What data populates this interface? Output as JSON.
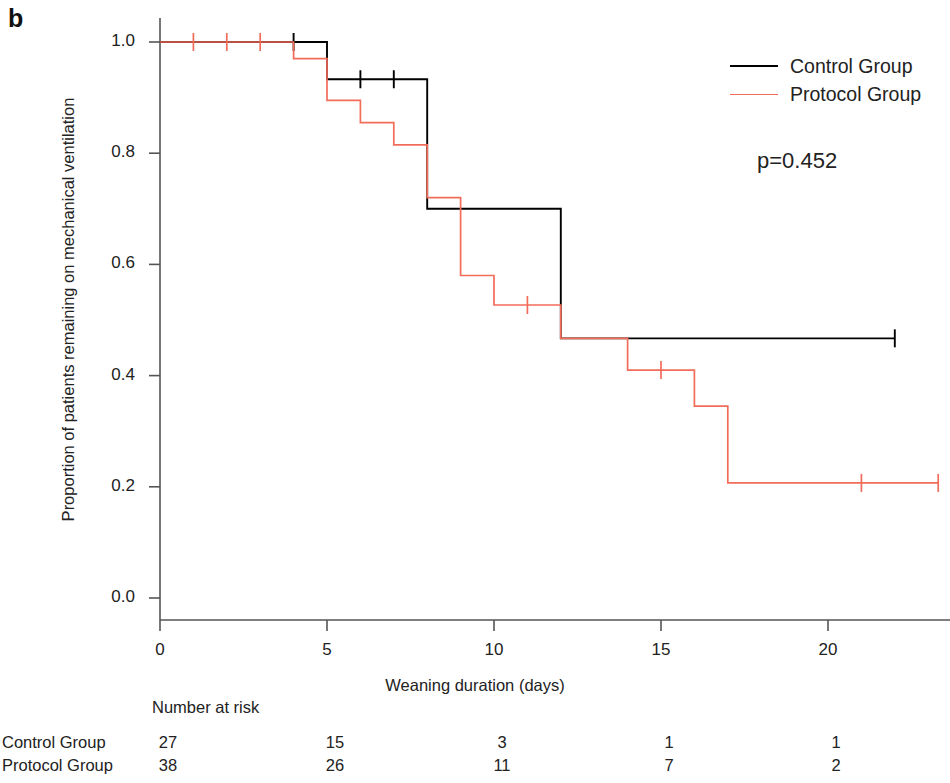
{
  "panel": {
    "label": "b"
  },
  "legend": {
    "position": "top-right",
    "items": [
      {
        "label": "Control Group",
        "color": "#000000"
      },
      {
        "label": "Protocol Group",
        "color": "#f26c5a"
      }
    ]
  },
  "stats": {
    "p_value_text": "p=0.452"
  },
  "risk_table": {
    "title": "Number at risk",
    "times": [
      0,
      5,
      10,
      15,
      20
    ],
    "rows": [
      {
        "name": "Control Group",
        "values": [
          "27",
          "15",
          "3",
          "1",
          "1"
        ]
      },
      {
        "name": "Protocol Group",
        "values": [
          "38",
          "26",
          "11",
          "7",
          "2"
        ]
      }
    ]
  },
  "axes": {
    "x_ticks": [
      "0",
      "5",
      "10",
      "15",
      "20"
    ],
    "y_ticks": [
      "0.0",
      "0.2",
      "0.4",
      "0.6",
      "0.8",
      "1.0"
    ]
  },
  "chart_data": {
    "type": "line",
    "subtype": "kaplan-meier-step",
    "title": "",
    "xlabel": "Weaning duration (days)",
    "ylabel": "Proportion of patients remaining on mechanical ventilation",
    "xlim": [
      0,
      23.5
    ],
    "ylim": [
      0.0,
      1.0
    ],
    "x_ticks": [
      0,
      5,
      10,
      15,
      20
    ],
    "y_ticks": [
      0.0,
      0.2,
      0.4,
      0.6,
      0.8,
      1.0
    ],
    "grid": false,
    "legend_position": "top-right",
    "annotations": [
      {
        "text": "p=0.452",
        "x": 18.0,
        "y": 0.78
      }
    ],
    "series": [
      {
        "name": "Control Group",
        "color": "#000000",
        "steps": [
          {
            "t": 0,
            "s": 1.0
          },
          {
            "t": 5,
            "s": 0.933
          },
          {
            "t": 8,
            "s": 0.7
          },
          {
            "t": 12,
            "s": 0.467
          },
          {
            "t": 22,
            "s": 0.467
          }
        ],
        "censor_times": [
          4,
          6,
          7,
          22
        ],
        "censor_values": [
          1.0,
          0.933,
          0.933,
          0.467
        ]
      },
      {
        "name": "Protocol Group",
        "color": "#f26c5a",
        "steps": [
          {
            "t": 0,
            "s": 1.0
          },
          {
            "t": 4,
            "s": 0.97
          },
          {
            "t": 5,
            "s": 0.895
          },
          {
            "t": 6,
            "s": 0.855
          },
          {
            "t": 7,
            "s": 0.815
          },
          {
            "t": 8,
            "s": 0.72
          },
          {
            "t": 9,
            "s": 0.58
          },
          {
            "t": 10,
            "s": 0.527
          },
          {
            "t": 12,
            "s": 0.467
          },
          {
            "t": 14,
            "s": 0.41
          },
          {
            "t": 16,
            "s": 0.345
          },
          {
            "t": 17,
            "s": 0.207
          },
          {
            "t": 23.3,
            "s": 0.207
          }
        ],
        "censor_times": [
          1,
          2,
          3,
          11,
          15,
          21,
          23.3
        ],
        "censor_values": [
          1.0,
          1.0,
          1.0,
          0.527,
          0.41,
          0.207,
          0.207
        ]
      }
    ]
  }
}
